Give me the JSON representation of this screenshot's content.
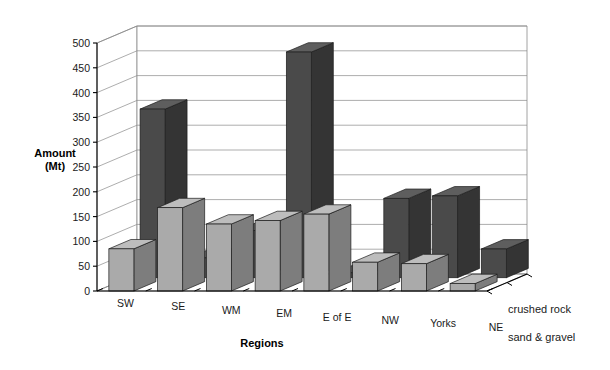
{
  "chart_data": {
    "type": "bar",
    "title": "",
    "subtitle": "",
    "xlabel": "Regions",
    "ylabel": "Amount\n(Mt)",
    "ylabel_line1": "Amount",
    "ylabel_line2": "(Mt)",
    "categories": [
      "SW",
      "SE",
      "WM",
      "EM",
      "E of E",
      "NW",
      "Yorks",
      "NE"
    ],
    "yticks": [
      0,
      50,
      100,
      150,
      200,
      250,
      300,
      350,
      400,
      450,
      500
    ],
    "ylim": [
      0,
      500
    ],
    "grid": true,
    "three_d": true,
    "legend_position": "right-depth-axis",
    "series": [
      {
        "name": "crushed rock",
        "color": "#4a4a4a",
        "row": "back",
        "values": [
          340,
          40,
          95,
          455,
          10,
          160,
          165,
          58
        ]
      },
      {
        "name": "sand & gravel",
        "color": "#aaaaaa",
        "row": "front",
        "values": [
          85,
          168,
          135,
          142,
          155,
          58,
          55,
          15
        ]
      }
    ]
  },
  "legend": {
    "items": [
      {
        "label": "crushed rock"
      },
      {
        "label": "sand & gravel"
      }
    ]
  },
  "axes": {
    "y_title_line1": "Amount",
    "y_title_line2": "(Mt)",
    "x_title": "Regions"
  },
  "colors": {
    "crushed_rock": "#4a4a4a",
    "crushed_rock_top": "#5e5e5e",
    "crushed_rock_side": "#343434",
    "sand_gravel": "#aaaaaa",
    "sand_gravel_top": "#bdbdbd",
    "sand_gravel_side": "#7d7d7d",
    "grid": "#8a8a8a",
    "axis": "#000000",
    "background": "#ffffff"
  }
}
